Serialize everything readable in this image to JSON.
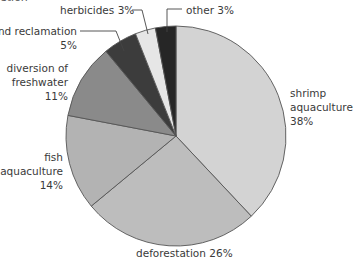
{
  "chart_data": {
    "type": "pie",
    "title": "",
    "start_angle_deg": 0,
    "direction": "clockwise",
    "center": [
      176,
      136
    ],
    "radius": 110,
    "slices": [
      {
        "label": "shrimp aquaculture",
        "value": 38,
        "display": [
          "shrimp",
          "aquaculture",
          "38%"
        ],
        "color": "#d3d3d3"
      },
      {
        "label": "deforestation",
        "value": 26,
        "display": [
          "deforestation 26%"
        ],
        "color": "#bdbdbd"
      },
      {
        "label": "fish aquaculture",
        "value": 14,
        "display": [
          "fish",
          "aquaculture",
          "14%"
        ],
        "color": "#b3b3b3"
      },
      {
        "label": "diversion of freshwater",
        "value": 11,
        "display": [
          "diversion of",
          "freshwater",
          "11%"
        ],
        "color": "#8a8a8a"
      },
      {
        "label": "land reclamation",
        "value": 5,
        "display": [
          "land reclamation",
          "5%"
        ],
        "color": "#3c3c3c"
      },
      {
        "label": "herbicides",
        "value": 3,
        "display": [
          "herbicides 3%"
        ],
        "color": "#e6e6e6"
      },
      {
        "label": "other",
        "value": 3,
        "display": [
          "other 3%"
        ],
        "color": "#262626"
      }
    ],
    "stroke_color": "#555555"
  },
  "labels": {
    "shrimp": [
      "shrimp",
      "aquaculture",
      "38%"
    ],
    "deforestation": "deforestation 26%",
    "fish": [
      "fish",
      "aquaculture",
      "14%"
    ],
    "freshwater": [
      "diversion of",
      "freshwater",
      "11%"
    ],
    "land": [
      "land reclamation",
      "5%"
    ],
    "herbicides": "herbicides 3%",
    "other": "other 3%"
  },
  "cropped_top_text": "etion"
}
